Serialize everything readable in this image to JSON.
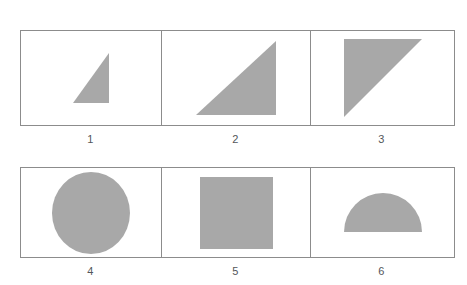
{
  "page": {
    "background_color": "#ffffff",
    "shape_fill_color": "#a8a8a8",
    "border_color": "#8c8c8c",
    "label_color": "#53565a"
  },
  "rows": [
    {
      "row_index": 1,
      "cells": [
        {
          "label": "1",
          "shape": "right-triangle",
          "orientation": "right-angle-bottom-right",
          "size": "small"
        },
        {
          "label": "2",
          "shape": "right-triangle",
          "orientation": "right-angle-bottom-right",
          "size": "large"
        },
        {
          "label": "3",
          "shape": "right-triangle",
          "orientation": "right-angle-top-left",
          "size": "large"
        }
      ]
    },
    {
      "row_index": 2,
      "cells": [
        {
          "label": "4",
          "shape": "circle",
          "orientation": "none",
          "size": "large"
        },
        {
          "label": "5",
          "shape": "square",
          "orientation": "none",
          "size": "large"
        },
        {
          "label": "6",
          "shape": "semicircle",
          "orientation": "flat-side-down",
          "size": "large"
        }
      ]
    }
  ],
  "labels": {
    "row1": [
      "1",
      "2",
      "3"
    ],
    "row2": [
      "4",
      "5",
      "6"
    ]
  }
}
